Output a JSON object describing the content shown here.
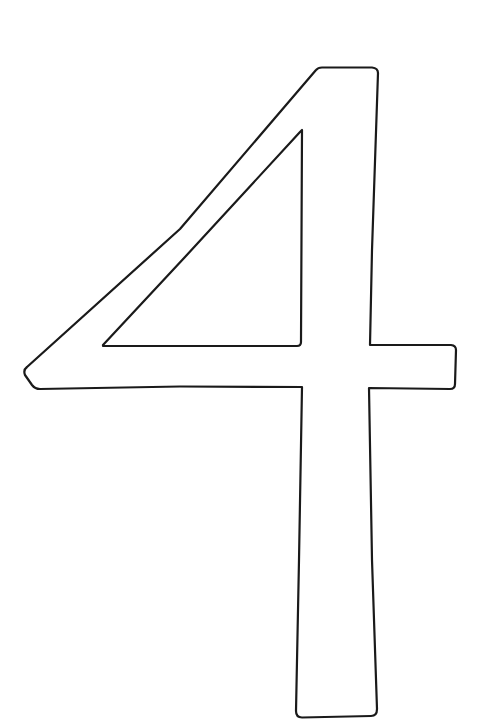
{
  "page": {
    "glyph": "4"
  },
  "style": {
    "background": "#ffffff",
    "stroke": "#1a1a1a",
    "fill": "#ffffff",
    "stroke_width": 2.2
  },
  "shape": {
    "outer_path": "M 316 70 Q 318 67.5 322 67.5 L 372 67.5 Q 378 68 378 73 L 372 250 L 370 345 L 451 345 Q 456 345.5 456 350 L 455 384 Q 455 389 450 389 L 369 388 L 372 560 L 377 709 Q 377 716 371 716 L 302 717.5 Q 296 717.5 296 711 L 299 560 L 302 387 L 180 386.5 L 40 389 Q 35 389 32 385 L 25 375 Q 23 370 27 367 L 180 229 Z",
    "inner_path": "M 302 130 L 301 342 Q 301 346 297 346 L 103 346 L 103 345 L 185 257 L 300 132 Z"
  }
}
